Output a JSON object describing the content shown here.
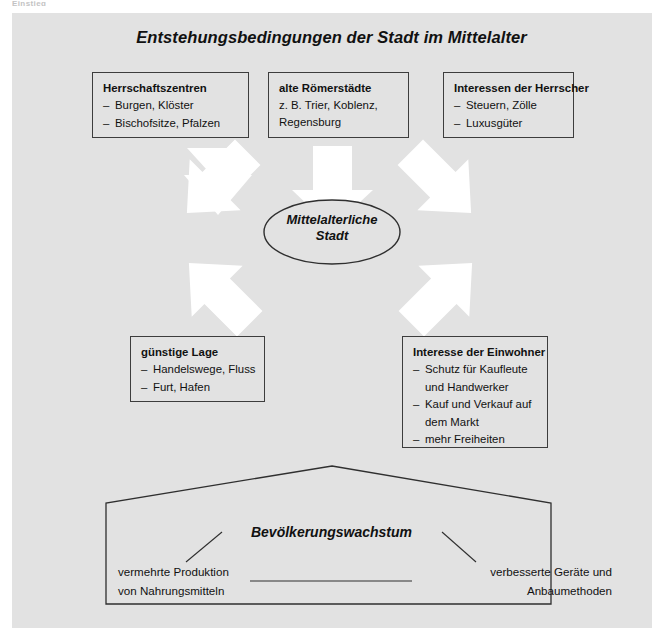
{
  "page": {
    "cropped_header_text": "Einstieg",
    "background_color": "#ffffff",
    "panel_color": "#e2e2e2",
    "line_color": "#3d3d3d",
    "arrow_color": "#ffffff"
  },
  "title": "Entstehungsbedingungen der Stadt im Mittelalter",
  "top_boxes": [
    {
      "heading": "Herrschaftszentren",
      "items": [
        "Burgen, Klöster",
        "Bischofsitze, Pfalzen"
      ],
      "plain_lines": []
    },
    {
      "heading": "alte Römerstädte",
      "items": [],
      "plain_lines": [
        "z. B. Trier, Koblenz,",
        "Regensburg"
      ]
    },
    {
      "heading": "Interessen der Herrscher",
      "items": [
        "Steuern, Zölle",
        "Luxusgüter"
      ],
      "plain_lines": []
    }
  ],
  "center": {
    "line1": "Mittelalterliche",
    "line2": "Stadt"
  },
  "bottom_boxes": [
    {
      "heading": "günstige Lage",
      "items": [
        "Handelswege, Fluss",
        "Furt, Hafen"
      ],
      "plain_lines": []
    },
    {
      "heading": "Interesse der Einwohner",
      "items": [
        "Schutz für Kaufleute|und Handwerker",
        "Kauf und Verkauf auf|dem Markt",
        "mehr Freiheiten"
      ],
      "plain_lines": []
    }
  ],
  "pentagon": {
    "title": "Bevölkerungswachstum",
    "left_line1": "vermehrte Produktion",
    "left_line2": "von Nahrungsmitteln",
    "right_line1": "verbesserte Geräte und",
    "right_line2": "Anbaumethoden"
  },
  "arrows": [
    {
      "name": "arrow-from-herrschaftszentren",
      "direction": "down-right"
    },
    {
      "name": "arrow-from-roemerstaedte",
      "direction": "down"
    },
    {
      "name": "arrow-from-interessen-herrscher",
      "direction": "down-left"
    },
    {
      "name": "arrow-from-guenstige-lage",
      "direction": "up-right"
    },
    {
      "name": "arrow-from-interesse-einwohner",
      "direction": "up-left"
    }
  ]
}
